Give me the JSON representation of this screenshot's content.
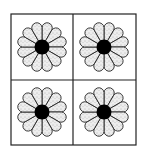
{
  "figure": {
    "grid": {
      "rows": 2,
      "cols": 2,
      "left": 11,
      "top": 14,
      "right": 136,
      "bottom": 145,
      "divider_x": 73,
      "divider_y": 80
    },
    "colors": {
      "line": "#222222",
      "petal_fill": "#ededed",
      "stipple": "#7a7a7a",
      "center": "#000000",
      "background": "#ffffff"
    },
    "flower": {
      "petal_count": 12,
      "petal_outer_radius": 27,
      "center_radius": 7.5,
      "fill": "stippled"
    },
    "cells": [
      {
        "name": "top-left",
        "cx": 42,
        "cy": 47
      },
      {
        "name": "top-right",
        "cx": 104,
        "cy": 47
      },
      {
        "name": "bottom-left",
        "cx": 42,
        "cy": 112
      },
      {
        "name": "bottom-right",
        "cx": 104,
        "cy": 112
      }
    ]
  }
}
